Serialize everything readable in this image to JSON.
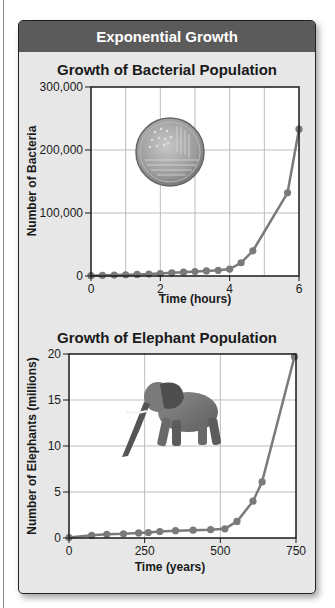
{
  "header": {
    "title": "Exponential Growth"
  },
  "colors": {
    "header_bg": "#5b5b5b",
    "panel_bg": "#e7e7e7",
    "plot_bg": "#ffffff",
    "series": "#7a7a7a",
    "grid": "#bdbdbd"
  },
  "chart_data": [
    {
      "type": "line",
      "title": "Growth of Bacterial Population",
      "xlabel": "Time (hours)",
      "ylabel": "Number of Bacteria",
      "xlim": [
        0,
        6
      ],
      "ylim": [
        0,
        300000
      ],
      "x_ticks": [
        "0",
        "2",
        "4",
        "6"
      ],
      "y_ticks": [
        "0",
        "100,000",
        "200,000",
        "300,000"
      ],
      "grid": true,
      "illustration": "petri-dish",
      "series": [
        {
          "name": "Bacteria",
          "x": [
            0,
            0.33,
            0.67,
            1.0,
            1.33,
            1.67,
            2.0,
            2.33,
            2.67,
            3.0,
            3.33,
            3.67,
            4.0,
            4.33,
            4.67,
            5.67,
            6.0
          ],
          "values": [
            500,
            1000,
            1500,
            2000,
            2500,
            3000,
            4000,
            5000,
            6000,
            7000,
            8000,
            9000,
            11000,
            21000,
            40000,
            132000,
            233000
          ]
        }
      ]
    },
    {
      "type": "line",
      "title": "Growth of Elephant Population",
      "xlabel": "Time (years)",
      "ylabel": "Number of Elephants (millions)",
      "xlim": [
        0,
        750
      ],
      "ylim": [
        0,
        20
      ],
      "x_ticks": [
        "0",
        "250",
        "500",
        "750"
      ],
      "y_ticks": [
        "0",
        "5",
        "10",
        "15",
        "20"
      ],
      "grid": true,
      "illustration": "elephant",
      "series": [
        {
          "name": "Elephants",
          "x": [
            0,
            75,
            125,
            180,
            230,
            262,
            300,
            352,
            410,
            468,
            515,
            555,
            608,
            638,
            745
          ],
          "values": [
            0.05,
            0.3,
            0.4,
            0.45,
            0.55,
            0.6,
            0.7,
            0.8,
            0.85,
            0.9,
            1.0,
            1.8,
            4.0,
            6.1,
            19.7
          ]
        }
      ]
    }
  ]
}
